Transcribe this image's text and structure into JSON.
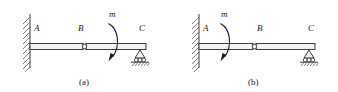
{
  "figure": {
    "type": "engineering-beam-diagram",
    "line_color": "#2b2b2b",
    "fill_color": "#f2f2f2",
    "background": "#ffffff",
    "panels": [
      {
        "id": "a",
        "caption": "(a)",
        "caption_x": 84,
        "caption_y": 84,
        "origin_x": 0,
        "beam": {
          "y_top": 43.5,
          "y_bottom": 49.5,
          "x_start": 30,
          "x_end": 146
        },
        "wall": {
          "x": 30,
          "y_top": 14,
          "y_bottom": 68,
          "hatch_side": "left",
          "hatch_count": 11
        },
        "labels": [
          {
            "name": "A",
            "text": "A",
            "x": 35,
            "y": 30
          },
          {
            "name": "B",
            "text": "B",
            "x": 79,
            "y": 30
          },
          {
            "name": "C",
            "text": "C",
            "x": 140,
            "y": 30
          },
          {
            "name": "m",
            "text": "m",
            "x": 111,
            "y": 16
          }
        ],
        "hinge": {
          "x": 84,
          "y": 46.5,
          "r": 2.3
        },
        "roller_support": {
          "x": 140,
          "y_top": 49.5,
          "wheels": 3
        },
        "moment": {
          "label": "m",
          "arc_x": 113,
          "arc_top_y": 22,
          "arc_bottom_y": 60,
          "direction": "clockwise",
          "side_of_hinge": "right"
        }
      },
      {
        "id": "b",
        "caption": "(b)",
        "caption_x": 252,
        "caption_y": 84,
        "origin_x": 169,
        "beam": {
          "y_top": 43.5,
          "y_bottom": 49.5,
          "x_start": 199,
          "x_end": 315
        },
        "wall": {
          "x": 199,
          "y_top": 14,
          "y_bottom": 68,
          "hatch_side": "left",
          "hatch_count": 11
        },
        "labels": [
          {
            "name": "A",
            "text": "A",
            "x": 204,
            "y": 30
          },
          {
            "name": "B",
            "text": "B",
            "x": 258,
            "y": 30
          },
          {
            "name": "C",
            "text": "C",
            "x": 309,
            "y": 30
          },
          {
            "name": "m",
            "text": "m",
            "x": 223,
            "y": 16
          }
        ],
        "hinge": {
          "x": 254,
          "y": 46.5,
          "r": 2.3
        },
        "roller_support": {
          "x": 309,
          "y_top": 49.5,
          "wheels": 3
        },
        "moment": {
          "label": "m",
          "arc_x": 225,
          "arc_top_y": 22,
          "arc_bottom_y": 60,
          "direction": "clockwise",
          "side_of_hinge": "left"
        }
      }
    ]
  }
}
